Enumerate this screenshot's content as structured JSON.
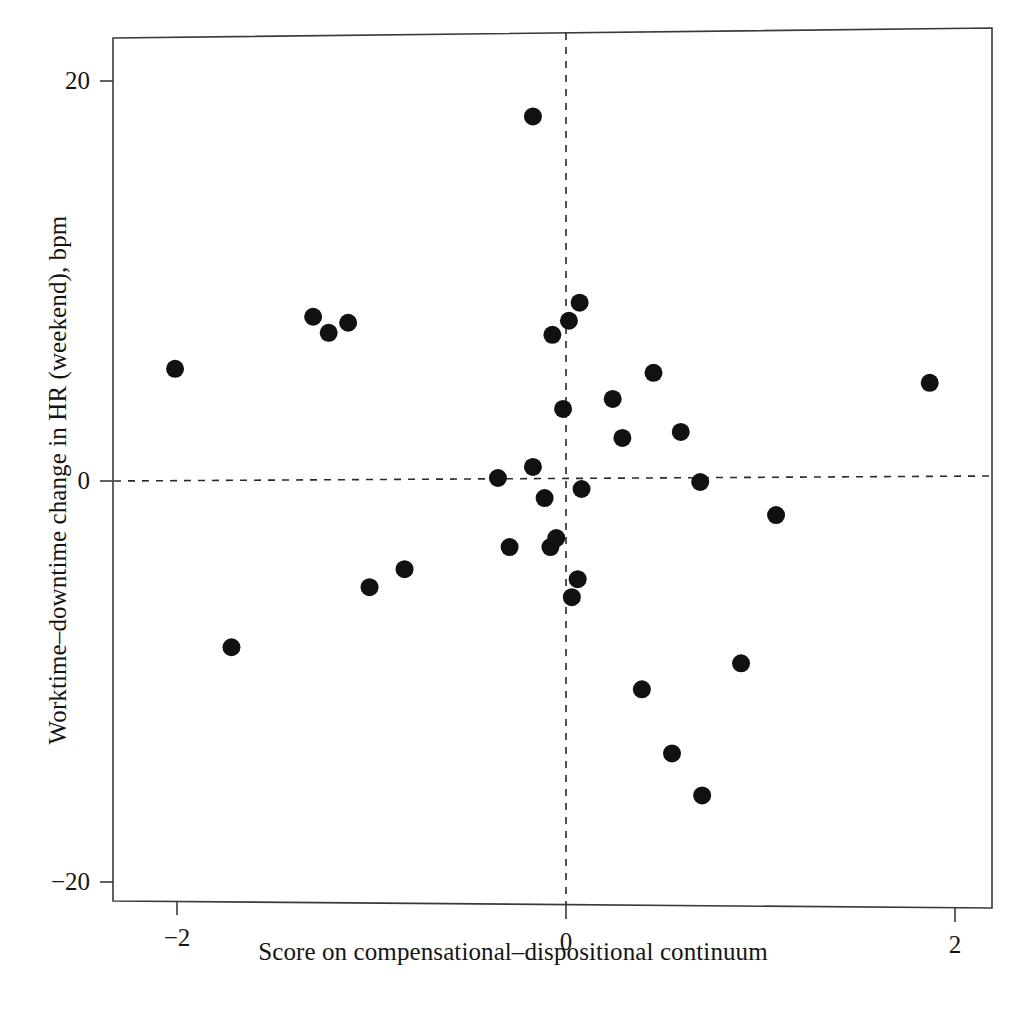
{
  "chart_data": {
    "type": "scatter",
    "title": "",
    "xlabel": "Score on compensational–dispositional continuum",
    "ylabel": "Worktime–downtime change in HR (weekend), bpm",
    "xlim": [
      -2.33,
      2.19
    ],
    "ylim": [
      -22.2,
      22.2
    ],
    "xticks": [
      -2,
      0,
      2
    ],
    "xticklabels": [
      "−2",
      "0",
      "2"
    ],
    "yticks": [
      20,
      0,
      -20
    ],
    "yticklabels": [
      "20",
      "0",
      "−20"
    ],
    "grid": false,
    "legend": null,
    "reference_lines": [
      {
        "name": "vertical-zero-line",
        "axis": "x",
        "value": 0,
        "style": "dashed"
      },
      {
        "name": "horizontal-zero-line",
        "axis": "y",
        "value": 0,
        "style": "dashed"
      }
    ],
    "marker": {
      "shape": "circle",
      "color": "#111111",
      "size_px": 9
    },
    "n_points": 32,
    "points": [
      {
        "x": -2.01,
        "y": 5.6
      },
      {
        "x": -1.72,
        "y": -8.3
      },
      {
        "x": -1.3,
        "y": 8.2
      },
      {
        "x": -1.22,
        "y": 7.4
      },
      {
        "x": -1.12,
        "y": 7.9
      },
      {
        "x": -1.01,
        "y": -5.3
      },
      {
        "x": -0.83,
        "y": -4.4
      },
      {
        "x": -0.35,
        "y": 0.15
      },
      {
        "x": -0.29,
        "y": -3.3
      },
      {
        "x": -0.17,
        "y": 18.2
      },
      {
        "x": -0.17,
        "y": 0.7
      },
      {
        "x": -0.11,
        "y": -0.85
      },
      {
        "x": -0.08,
        "y": -3.3
      },
      {
        "x": -0.07,
        "y": 7.3
      },
      {
        "x": -0.05,
        "y": -2.85
      },
      {
        "x": -0.015,
        "y": 3.6
      },
      {
        "x": 0.015,
        "y": 8.0
      },
      {
        "x": 0.03,
        "y": -5.8
      },
      {
        "x": 0.06,
        "y": -4.9
      },
      {
        "x": 0.07,
        "y": 8.9
      },
      {
        "x": 0.08,
        "y": -0.4
      },
      {
        "x": 0.24,
        "y": 4.1
      },
      {
        "x": 0.29,
        "y": 2.15
      },
      {
        "x": 0.39,
        "y": -10.4
      },
      {
        "x": 0.45,
        "y": 5.4
      },
      {
        "x": 0.545,
        "y": -13.6
      },
      {
        "x": 0.59,
        "y": 2.45
      },
      {
        "x": 0.69,
        "y": -0.05
      },
      {
        "x": 0.7,
        "y": -15.7
      },
      {
        "x": 0.9,
        "y": -9.1
      },
      {
        "x": 1.08,
        "y": -1.7
      },
      {
        "x": 1.87,
        "y": 4.9
      }
    ]
  },
  "axes": {
    "x_title": "Score on compensational–dispositional continuum",
    "y_title": "Worktime–downtime change in HR (weekend), bpm",
    "x_tick_labels": [
      "−2",
      "0",
      "2"
    ],
    "y_tick_labels": [
      "20",
      "0",
      "−20"
    ]
  },
  "colors": {
    "marker": "#111111",
    "frame": "#3a3a3a",
    "reference_line": "#2a2a2a",
    "background": "#ffffff",
    "text": "#141414"
  }
}
